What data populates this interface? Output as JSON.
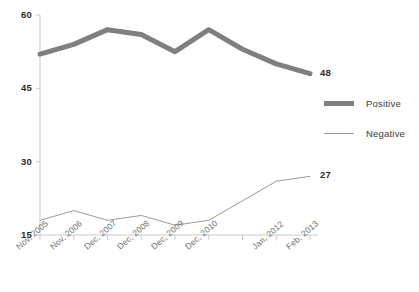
{
  "chart_data": {
    "type": "line",
    "title": "",
    "subtitle": "",
    "xlabel": "",
    "ylabel": "",
    "ylim": [
      15,
      60
    ],
    "yticks": [
      15,
      30,
      45,
      60
    ],
    "ytick_labels": [
      "15",
      "30",
      "45",
      "60"
    ],
    "grid": false,
    "legend_position": "right",
    "categories": [
      "Nov, 2005",
      "Nov, 2006",
      "Dec, 2007",
      "Dec, 2008",
      "Dec, 2009",
      "Dec, 2010",
      "",
      "Jan, 2012",
      "Feb, 2013"
    ],
    "series": [
      {
        "name": "Positive",
        "color": "#7f7f7f",
        "width": 5,
        "values": [
          52,
          54,
          57,
          56,
          52.5,
          57,
          53,
          50,
          48
        ],
        "end_label": "48"
      },
      {
        "name": "Negative",
        "color": "#9a9a9a",
        "width": 1,
        "values": [
          18,
          20,
          18,
          19,
          17,
          18,
          22,
          26,
          27
        ],
        "end_label": "27"
      }
    ],
    "annotations": [
      {
        "text": "48",
        "series": "Positive",
        "at_category": "Feb, 2013"
      },
      {
        "text": "27",
        "series": "Negative",
        "at_category": "Feb, 2013"
      }
    ]
  },
  "legend": {
    "items": [
      {
        "label": "Positive"
      },
      {
        "label": "Negative"
      }
    ]
  },
  "axis": {
    "line_color": "#c9c9c9"
  }
}
